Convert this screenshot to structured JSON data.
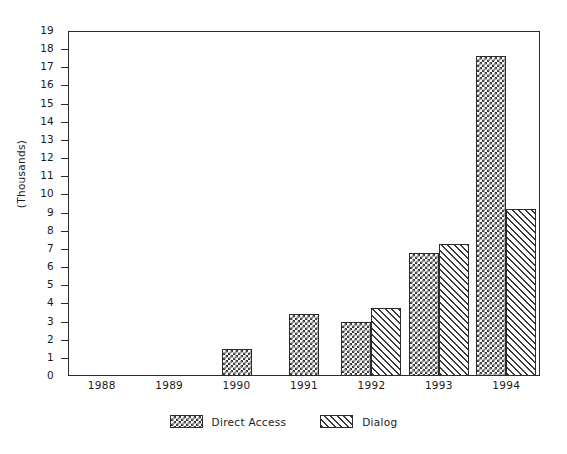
{
  "chart_data": {
    "type": "bar",
    "title": "",
    "xlabel": "",
    "ylabel": "(Thousands)",
    "categories": [
      "1988",
      "1989",
      "1990",
      "1991",
      "1992",
      "1993",
      "1994"
    ],
    "series": [
      {
        "name": "Direct Access",
        "pattern": "crosshatch",
        "values": [
          0,
          0,
          1.5,
          3.4,
          3.0,
          6.75,
          17.6
        ]
      },
      {
        "name": "Dialog",
        "pattern": "diagonal",
        "values": [
          0,
          0,
          0,
          0,
          3.75,
          7.25,
          9.2
        ]
      }
    ],
    "ylim": [
      0,
      19
    ],
    "ytick_labels": [
      "0",
      "1",
      "2",
      "3",
      "4",
      "5",
      "6",
      "7",
      "8",
      "9",
      "10",
      "11",
      "12",
      "13",
      "14",
      "15",
      "16",
      "17",
      "18",
      "19"
    ],
    "ytick_values": [
      0,
      1,
      2,
      3,
      4,
      5,
      6,
      7,
      8,
      9,
      10,
      11,
      12,
      13,
      14,
      15,
      16,
      17,
      18,
      19
    ],
    "grid": false,
    "legend_position": "bottom",
    "colors": {
      "ink": "#2b2b2b",
      "fill": "#3a3a3a",
      "background": "#ffffff"
    }
  },
  "legend": {
    "entries": [
      {
        "label": "Direct Access",
        "swatch": "crosshatch-swatch"
      },
      {
        "label": "Dialog",
        "swatch": "diagonal-swatch"
      }
    ]
  }
}
